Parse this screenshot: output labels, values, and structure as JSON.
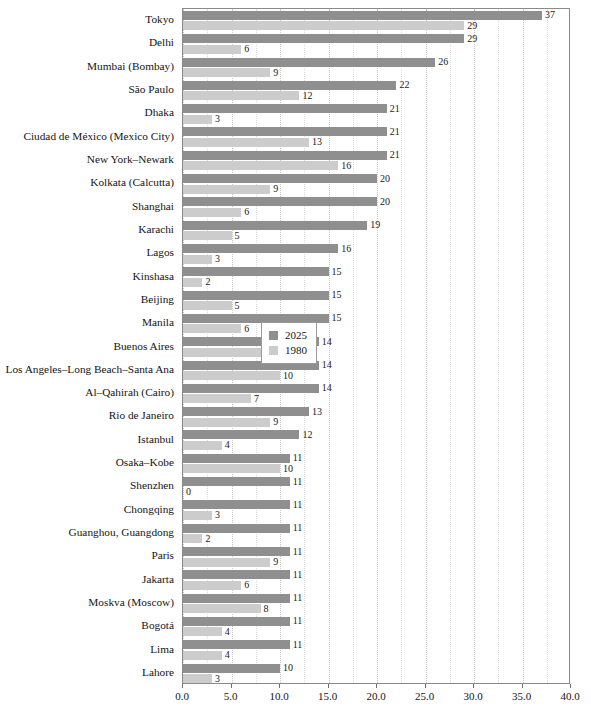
{
  "chart_data": {
    "type": "bar",
    "orientation": "horizontal",
    "title": "",
    "subtitle": "",
    "xlabel": "",
    "ylabel": "",
    "xlim": [
      0.0,
      40.0
    ],
    "xticks": [
      "0.0",
      "5.0",
      "10.0",
      "15.0",
      "20.0",
      "25.0",
      "30.0",
      "35.0",
      "40.0"
    ],
    "xtick_values": [
      0,
      5,
      10,
      15,
      20,
      25,
      30,
      35,
      40
    ],
    "grid": true,
    "grid_axis": "x",
    "legend_position": "middle-right-inside",
    "categories": [
      "Tokyo",
      "Delhi",
      "Mumbai (Bombay)",
      "São Paulo",
      "Dhaka",
      "Ciudad de México (Mexico City)",
      "New York–Newark",
      "Kolkata (Calcutta)",
      "Shanghai",
      "Karachi",
      "Lagos",
      "Kinshasa",
      "Beijing",
      "Manila",
      "Buenos Aires",
      "Los Angeles–Long Beach–Santa Ana",
      "Al–Qahirah (Cairo)",
      "Rio de Janeiro",
      "Istanbul",
      "Osaka–Kobe",
      "Shenzhen",
      "Chongqing",
      "Guanghou, Guangdong",
      "Paris",
      "Jakarta",
      "Moskva (Moscow)",
      "Bogotá",
      "Lima",
      "Lahore"
    ],
    "series": [
      {
        "name": "2025",
        "color": "#8f8f8f",
        "values": [
          37,
          29,
          26,
          22,
          21,
          21,
          21,
          20,
          20,
          19,
          16,
          15,
          15,
          15,
          14,
          14,
          14,
          13,
          12,
          11,
          11,
          11,
          11,
          11,
          11,
          11,
          11,
          11,
          10
        ],
        "labels": [
          "37",
          "29",
          "26",
          "22",
          "21",
          "21",
          "21",
          "20",
          "20",
          "19",
          "16",
          "15",
          "15",
          "15",
          "14",
          "14",
          "14",
          "13",
          "12",
          "11",
          "11",
          "11",
          "11",
          "11",
          "11",
          "11",
          "11",
          "11",
          "10"
        ]
      },
      {
        "name": "1980",
        "color": "#cccccc",
        "values": [
          29,
          6,
          9,
          12,
          3,
          13,
          16,
          9,
          6,
          5,
          3,
          2,
          5,
          6,
          9,
          10,
          7,
          9,
          4,
          10,
          0,
          3,
          2,
          9,
          6,
          8,
          4,
          4,
          3
        ],
        "labels": [
          "29",
          "6",
          "9",
          "12",
          "3",
          "13",
          "16",
          "9",
          "6",
          "5",
          "3",
          "2",
          "5",
          "6",
          "9",
          "10",
          "7",
          "9",
          "4",
          "10",
          "0",
          "3",
          "2",
          "9",
          "6",
          "8",
          "4",
          "4",
          "3"
        ]
      }
    ]
  },
  "legend": {
    "entries": [
      {
        "label": "2025",
        "color": "#8f8f8f"
      },
      {
        "label": "1980",
        "color": "#cccccc"
      }
    ]
  }
}
